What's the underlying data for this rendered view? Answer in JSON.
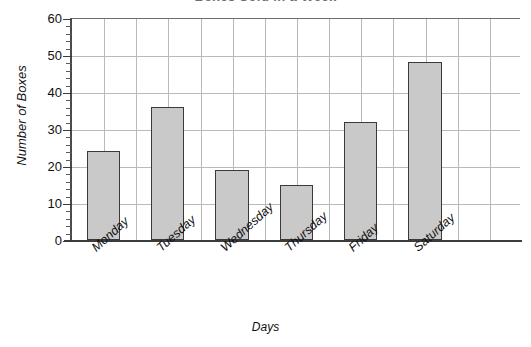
{
  "chart_data": {
    "type": "bar",
    "title": "Boxes Sold in a Week",
    "title_note": "clipped at top edge of screenshot",
    "xlabel": "Days",
    "ylabel": "Number of Boxes",
    "categories": [
      "Monday",
      "Tuesday",
      "Wednesday",
      "Thursday",
      "Friday",
      "Saturday"
    ],
    "values": [
      24,
      36,
      19,
      15,
      32,
      48
    ],
    "ylim": [
      0,
      60
    ],
    "ytick_step": 10,
    "yticks": [
      0,
      10,
      20,
      30,
      40,
      50,
      60
    ],
    "ytick_labels": [
      "0",
      "10",
      "20",
      "30",
      "40",
      "50",
      "60"
    ],
    "minor_tick_step": 2,
    "grid": true,
    "legend": false,
    "bar_color": "#c9c9c9",
    "bar_edge_color": "#3a3a3a",
    "grid_color": "#b9b9b9",
    "axis_color": "#3c3c3c",
    "background": "#ffffff",
    "xtick_rotation": -42
  }
}
